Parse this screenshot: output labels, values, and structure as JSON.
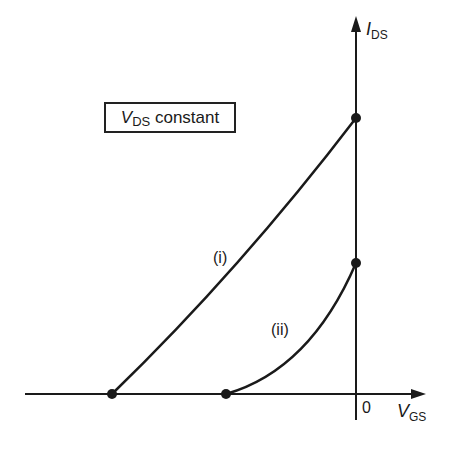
{
  "diagram": {
    "title_box": {
      "symbol": "V",
      "subscript": "DS",
      "text": " constant"
    },
    "y_axis": {
      "symbol": "I",
      "subscript": "DS"
    },
    "x_axis": {
      "symbol": "V",
      "subscript": "GS",
      "origin_label": "0"
    },
    "curves": [
      {
        "id": "i",
        "label": "(i)",
        "start": "x-axis intercept (negative V_GS, far)",
        "end": "I_DS-axis intercept (upper)"
      },
      {
        "id": "ii",
        "label": "(ii)",
        "start": "x-axis intercept (negative V_GS, near)",
        "end": "I_DS-axis intercept (lower)"
      }
    ],
    "colors": {
      "ink": "#1a1a1a",
      "background": "#ffffff"
    }
  }
}
